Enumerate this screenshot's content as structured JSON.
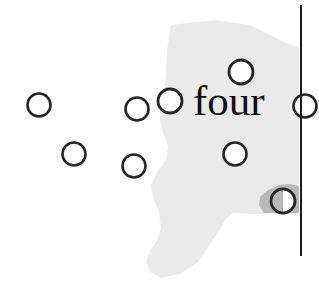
{
  "canvas": {
    "width": 319,
    "height": 302,
    "background_color": "#ffffff"
  },
  "text_label": {
    "value": "four",
    "font_style": "serif",
    "color": "#111111",
    "x": 193,
    "y": 79,
    "font_size": 43
  },
  "palette": {
    "background": "#ffffff",
    "region_light_gray": "#eaeaea",
    "region_dark_gray": "#b9b9b9",
    "circle_stroke": "#262626",
    "circle_fill": "#ffffff",
    "divider_line": "#1a1a1a"
  },
  "divider": {
    "name": "vertical-line",
    "orientation": "vertical",
    "x": 301,
    "y_start": 5,
    "y_end": 256,
    "thickness": 2,
    "color": "#1a1a1a"
  },
  "regions": [
    {
      "name": "light-gray-region",
      "fill": "#eaeaea",
      "points": "171,25 214,20 250,25 286,43 299,48 299,213 259,214 233,213 226,219 213,240 198,262 180,274 161,278 150,272 146,262 150,250 157,241 161,228 159,213 154,200 151,186 157,172 166,160 168,146 163,133 160,120 161,106 164,92 166,72 167,50"
    },
    {
      "name": "dark-gray-blob",
      "fill": "#b9b9b9",
      "points": "264,213 259,205 260,197 268,190 279,185 290,184 299,186 299,213"
    }
  ],
  "circles": [
    {
      "name": "circle-1",
      "cx": 39,
      "cy": 105,
      "r": 11.5,
      "fill": "#ffffff",
      "stroke": "#262626",
      "stroke_width": 2.6,
      "clipped": false,
      "half_shaded": false
    },
    {
      "name": "circle-2",
      "cx": 74,
      "cy": 154,
      "r": 11.5,
      "fill": "#ffffff",
      "stroke": "#262626",
      "stroke_width": 2.6,
      "clipped": false,
      "half_shaded": false
    },
    {
      "name": "circle-3",
      "cx": 137,
      "cy": 109,
      "r": 11.5,
      "fill": "#ffffff",
      "stroke": "#262626",
      "stroke_width": 2.6,
      "clipped": false,
      "half_shaded": false
    },
    {
      "name": "circle-4",
      "cx": 170,
      "cy": 101,
      "r": 12.0,
      "fill": "#ffffff",
      "stroke": "#262626",
      "stroke_width": 2.8,
      "clipped": false,
      "half_shaded": false
    },
    {
      "name": "circle-5",
      "cx": 241,
      "cy": 72,
      "r": 12.0,
      "fill": "#ffffff",
      "stroke": "#262626",
      "stroke_width": 2.8,
      "clipped": false,
      "half_shaded": false
    },
    {
      "name": "circle-6",
      "cx": 134,
      "cy": 166,
      "r": 11.5,
      "fill": "#ffffff",
      "stroke": "#262626",
      "stroke_width": 2.6,
      "clipped": false,
      "half_shaded": false
    },
    {
      "name": "circle-7",
      "cx": 235,
      "cy": 154,
      "r": 11.5,
      "fill": "#ffffff",
      "stroke": "#262626",
      "stroke_width": 2.6,
      "clipped": false,
      "half_shaded": false
    },
    {
      "name": "circle-8",
      "cx": 283,
      "cy": 201,
      "r": 12.0,
      "fill": "#ffffff",
      "stroke": "#262626",
      "stroke_width": 2.8,
      "clipped": false,
      "half_shaded": true
    },
    {
      "name": "circle-9-clipped",
      "cx": 305,
      "cy": 106,
      "r": 11.5,
      "fill": "#ffffff",
      "stroke": "#262626",
      "stroke_width": 2.6,
      "clipped": true,
      "half_shaded": false
    }
  ],
  "counts": {
    "visible_circles": 9,
    "regions": 2
  }
}
